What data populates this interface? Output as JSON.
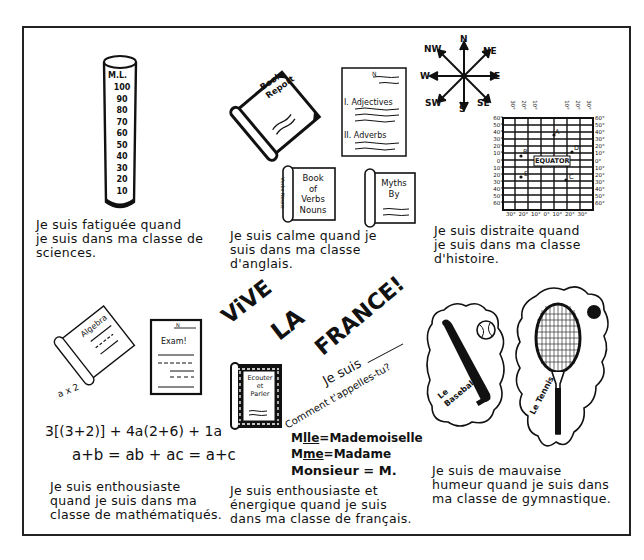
{
  "worksheet": {
    "panels": [
      {
        "subject": "sciences",
        "caption_lines": [
          "Je suis fatiguée quand",
          "je suis dans ma classe de",
          "sciences."
        ],
        "illustration": {
          "type": "graduated-cylinder",
          "label": "M.L.",
          "ticks": [
            "100",
            "90",
            "80",
            "70",
            "60",
            "50",
            "40",
            "30",
            "20",
            "10"
          ]
        }
      },
      {
        "subject": "anglais",
        "caption_lines": [
          "Je suis calme quand je",
          "suis dans ma classe",
          "d'anglais."
        ],
        "illustration": {
          "book_report": [
            "Book",
            "Report"
          ],
          "outline": {
            "name_line": "N",
            "sections": [
              "I. Adjectives",
              "II. Adverbs"
            ]
          },
          "verbs_book": {
            "spine": "Verbs Nouns",
            "title": [
              "Book",
              "of",
              "Verbs",
              "Nouns"
            ]
          },
          "myths_book": [
            "Myths",
            "By"
          ]
        }
      },
      {
        "subject": "histoire",
        "caption_lines": [
          "Je suis distraite quand",
          "je suis dans ma classe",
          "d'histoire."
        ],
        "illustration": {
          "compass": [
            "N",
            "NE",
            "E",
            "SE",
            "S",
            "SW",
            "W",
            "NW"
          ],
          "map_grid": {
            "top_labels": [
              "30°",
              "20°",
              "10°",
              "10°",
              "20°",
              "30°"
            ],
            "left_labels": [
              "60°",
              "50°",
              "40°",
              "30°",
              "20°",
              "10°",
              "0°",
              "10°",
              "20°",
              "30°",
              "40°",
              "50°",
              "60°"
            ],
            "right_labels": [
              "60°",
              "50°",
              "40°",
              "30°",
              "20°",
              "10°",
              "0°",
              "10°",
              "20°",
              "30°",
              "40°",
              "50°",
              "60°"
            ],
            "bottom_labels": [
              "30°",
              "20°",
              "10°",
              "0°",
              "10°",
              "20°",
              "30°"
            ],
            "equator_label": "EQUATOR",
            "points": [
              "A",
              "B",
              "C",
              "D",
              "E"
            ]
          }
        }
      },
      {
        "subject": "mathématiques",
        "caption_lines": [
          "Je suis enthousiaste",
          "quand je suis dans ma",
          "classe de mathématiqués."
        ],
        "illustration": {
          "algebra_book": "Algebra",
          "exam_paper": {
            "name_line": "N",
            "title": "Exam!"
          },
          "scribble": "a x 2",
          "equations": [
            "3[(3+2)] + 4a(2+6) + 1a",
            "a+b = ab + ac = a+c"
          ]
        }
      },
      {
        "subject": "français",
        "caption_lines": [
          "Je suis enthousiaste et",
          "énergique quand je suis",
          "dans ma classe de français."
        ],
        "illustration": {
          "banner_words": [
            "ViVE",
            "LA",
            "FRANCE!"
          ],
          "dialog": {
            "line1": "Je suis",
            "line2": "Comment t'appelles-tu?"
          },
          "book": [
            "Ecouter",
            "et",
            "Parler"
          ],
          "abbreviations": [
            {
              "abbr": "M",
              "sup": "lle",
              "full": "Mademoiselle"
            },
            {
              "abbr": "M",
              "sup": "me",
              "full": "Madame"
            },
            {
              "abbr": "Monsieur",
              "sup": "",
              "full": "M."
            }
          ]
        }
      },
      {
        "subject": "gymnastique",
        "caption_lines": [
          "Je suis de mauvaise",
          "humeur quand je suis dans",
          "ma classe de gymnastique."
        ],
        "illustration": {
          "baseball": [
            "Le",
            "Baseball"
          ],
          "tennis": "Le Tennis"
        }
      }
    ]
  }
}
